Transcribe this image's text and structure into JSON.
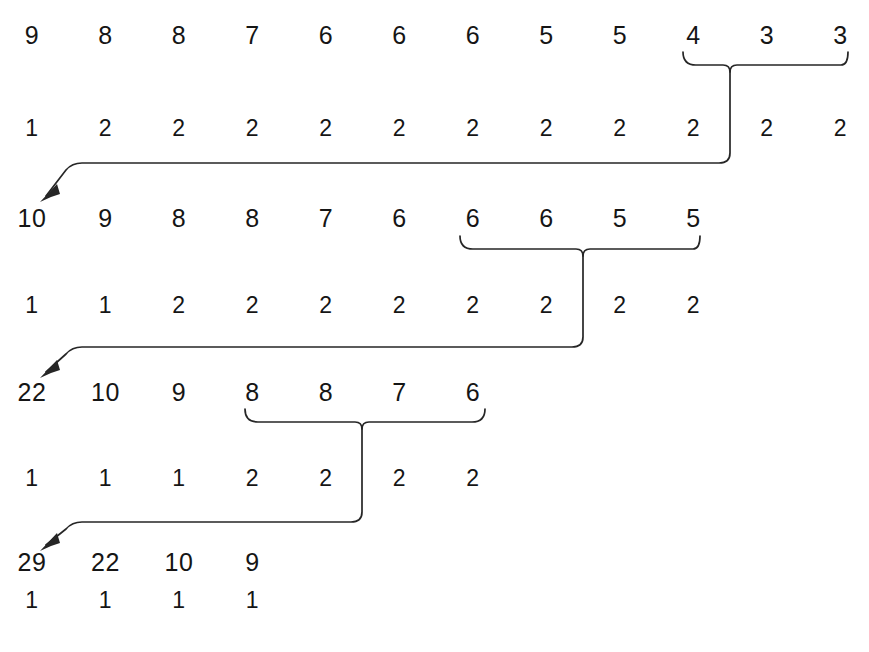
{
  "figure": {
    "type": "merge-tree-diagram",
    "background_color": "#ffffff",
    "ink_color": "#262626",
    "text_color": "#151515",
    "width": 869,
    "height": 652,
    "column_spacing": 73.5,
    "first_column_x": 32
  },
  "rows": [
    {
      "id": "stage1-values",
      "kind": "values",
      "y": 35,
      "values": [
        "9",
        "8",
        "8",
        "7",
        "6",
        "6",
        "6",
        "5",
        "5",
        "4",
        "3",
        "3"
      ]
    },
    {
      "id": "stage1-counts",
      "kind": "counts",
      "y": 128,
      "values": [
        "1",
        "2",
        "2",
        "2",
        "2",
        "2",
        "2",
        "2",
        "2",
        "2",
        "2",
        "2"
      ]
    },
    {
      "id": "stage2-values",
      "kind": "values",
      "y": 218,
      "values": [
        "10",
        "9",
        "8",
        "8",
        "7",
        "6",
        "6",
        "6",
        "5",
        "5"
      ]
    },
    {
      "id": "stage2-counts",
      "kind": "counts",
      "y": 305,
      "values": [
        "1",
        "1",
        "2",
        "2",
        "2",
        "2",
        "2",
        "2",
        "2",
        "2"
      ]
    },
    {
      "id": "stage3-values",
      "kind": "values",
      "y": 392,
      "values": [
        "22",
        "10",
        "9",
        "8",
        "8",
        "7",
        "6"
      ]
    },
    {
      "id": "stage3-counts",
      "kind": "counts",
      "y": 478,
      "values": [
        "1",
        "1",
        "1",
        "2",
        "2",
        "2",
        "2"
      ]
    },
    {
      "id": "stage4-values",
      "kind": "values",
      "y": 562,
      "values": [
        "29",
        "22",
        "10",
        "9"
      ]
    },
    {
      "id": "stage4-counts",
      "kind": "counts",
      "y": 600,
      "values": [
        "1",
        "1",
        "1",
        "1"
      ]
    }
  ],
  "braces": [
    {
      "id": "brace-stage1",
      "label": "brace over 4 3 3",
      "x_start": 683,
      "x_end": 848,
      "y": 52,
      "stem_x": 730,
      "grouped_values": [
        "4",
        "3",
        "3"
      ]
    },
    {
      "id": "brace-stage2",
      "label": "brace over 6 6 5 5",
      "x_start": 460,
      "x_end": 700,
      "y": 236,
      "stem_x": 583,
      "grouped_values": [
        "6",
        "6",
        "5",
        "5"
      ]
    },
    {
      "id": "brace-stage3",
      "label": "brace over 8 8 7 6",
      "x_start": 245,
      "x_end": 485,
      "y": 409,
      "stem_x": 362,
      "grouped_values": [
        "8",
        "8",
        "7",
        "6"
      ]
    }
  ],
  "connectors": [
    {
      "id": "connector-1",
      "from_stem_x": 730,
      "drop_to_y": 160,
      "horizontal_to_x": 72,
      "arrow_tip_x": 40,
      "arrow_tip_y": 200,
      "target_value": "10"
    },
    {
      "id": "connector-2",
      "from_stem_x": 583,
      "drop_to_y": 345,
      "horizontal_to_x": 72,
      "arrow_tip_x": 40,
      "arrow_tip_y": 374,
      "target_value": "22"
    },
    {
      "id": "connector-3",
      "from_stem_x": 362,
      "drop_to_y": 520,
      "horizontal_to_x": 72,
      "arrow_tip_x": 40,
      "arrow_tip_y": 547,
      "target_value": "29"
    }
  ]
}
